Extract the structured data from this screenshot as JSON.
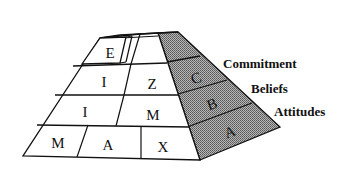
{
  "diagram": {
    "type": "pyramid",
    "front_rows": [
      {
        "row": "top",
        "cells": [
          "E"
        ]
      },
      {
        "row": "second",
        "cells": [
          "I",
          "Z"
        ]
      },
      {
        "row": "third",
        "cells": [
          "I",
          "M"
        ]
      },
      {
        "row": "bottom",
        "cells": [
          "M",
          "A",
          "X"
        ]
      }
    ],
    "side_face": {
      "shading": "#8a8a8a",
      "bands": [
        {
          "letter": "C",
          "label": "Commitment"
        },
        {
          "letter": "B",
          "label": "Beliefs"
        },
        {
          "letter": "A",
          "label": "Attitudes"
        }
      ]
    }
  }
}
